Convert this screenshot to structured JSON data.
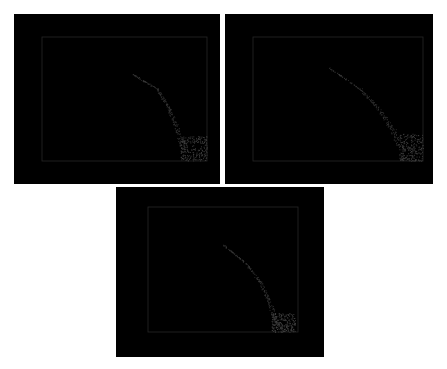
{
  "page": {
    "background": "#ffffff"
  },
  "chart_data": [
    {
      "type": "scatter",
      "panel": "top-left",
      "title": "",
      "xlabel": "",
      "ylabel": "",
      "background": "#000000",
      "frame_color": "#2a2a2a",
      "point_color": "#3a3a3a",
      "description": "Dense point cloud forming a curve descending from upper-middle to lower-right, with a dense rectangular cluster at the bottom right",
      "curve_norm": [
        [
          0.55,
          0.3
        ],
        [
          0.7,
          0.42
        ],
        [
          0.77,
          0.58
        ],
        [
          0.82,
          0.75
        ],
        [
          0.86,
          0.92
        ]
      ],
      "cluster_norm": {
        "x0": 0.84,
        "x1": 1.0,
        "y0": 0.8,
        "y1": 1.0
      },
      "grid": false
    },
    {
      "type": "scatter",
      "panel": "top-right",
      "title": "",
      "xlabel": "",
      "ylabel": "",
      "background": "#000000",
      "frame_color": "#2a2a2a",
      "point_color": "#3a3a3a",
      "description": "Same form as top-left: curve descending to dense cluster at lower right",
      "curve_norm": [
        [
          0.45,
          0.25
        ],
        [
          0.63,
          0.42
        ],
        [
          0.74,
          0.58
        ],
        [
          0.82,
          0.75
        ],
        [
          0.88,
          0.92
        ]
      ],
      "cluster_norm": {
        "x0": 0.86,
        "x1": 1.0,
        "y0": 0.78,
        "y1": 1.0
      },
      "grid": false
    },
    {
      "type": "scatter",
      "panel": "bottom",
      "title": "",
      "xlabel": "",
      "ylabel": "",
      "background": "#000000",
      "frame_color": "#2a2a2a",
      "point_color": "#3a3a3a",
      "description": "Curve descending from upper-middle to lower-right with vertical streaks reaching the bottom and a spike at the right edge",
      "curve_norm": [
        [
          0.5,
          0.3
        ],
        [
          0.65,
          0.45
        ],
        [
          0.76,
          0.62
        ],
        [
          0.82,
          0.8
        ],
        [
          0.88,
          0.97
        ]
      ],
      "cluster_norm": {
        "x0": 0.82,
        "x1": 0.98,
        "y0": 0.85,
        "y1": 1.0
      },
      "grid": false
    }
  ]
}
